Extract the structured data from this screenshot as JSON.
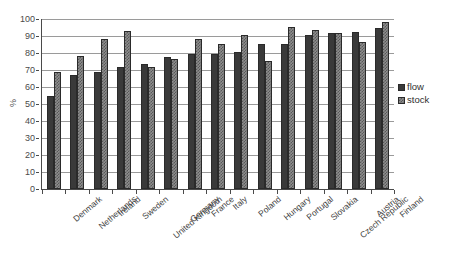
{
  "chart_data": {
    "type": "bar",
    "title": "",
    "xlabel": "",
    "ylabel": "%",
    "ylim": [
      0,
      100
    ],
    "yticks": [
      0,
      10,
      20,
      30,
      40,
      50,
      60,
      70,
      80,
      90,
      100
    ],
    "grid": true,
    "legend_position": "right",
    "categories": [
      "Denmark",
      "Netherlands",
      "Ireland",
      "Sweden",
      "United Kingdom",
      "Germany",
      "France",
      "Italy",
      "Poland",
      "Hungary",
      "Portugal",
      "Slovakia",
      "Czech Republic",
      "Austria",
      "Finland"
    ],
    "series": [
      {
        "name": "flow",
        "color": "#3a3a3a",
        "values": [
          55,
          67,
          69,
          71.5,
          73.5,
          77.5,
          79.5,
          79.5,
          80.5,
          85.5,
          85.5,
          90.5,
          91.5,
          92.5,
          94.5
        ]
      },
      {
        "name": "stock",
        "color": "#8e8e8e",
        "values": [
          69,
          78,
          88.5,
          93,
          71.5,
          76.5,
          88.5,
          85.5,
          90.5,
          75.5,
          95.5,
          93.5,
          91.5,
          86.5,
          98.5
        ]
      }
    ]
  },
  "axis": {
    "y_title": "%",
    "tick_labels": [
      "100",
      "90",
      "80",
      "70",
      "60",
      "50",
      "40",
      "30",
      "20",
      "10",
      "0"
    ]
  },
  "legend": {
    "items": [
      {
        "label": "flow"
      },
      {
        "label": "stock"
      }
    ]
  },
  "caption": {
    "text": ""
  }
}
